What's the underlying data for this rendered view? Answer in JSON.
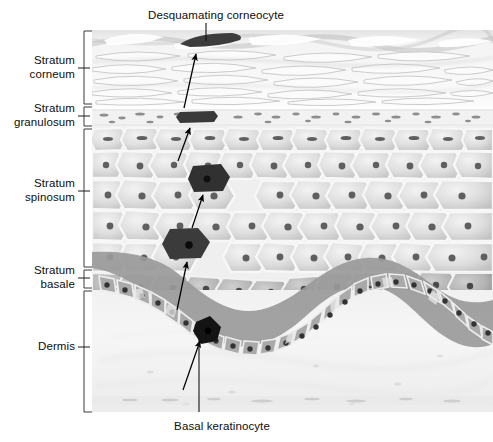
{
  "figure": {
    "width": 493,
    "height": 442,
    "background": "#ffffff"
  },
  "callouts": {
    "top": {
      "text": "Desquamating corneocyte",
      "x": 216,
      "y": 16
    },
    "bottom": {
      "text": "Basal keratinocyte",
      "x": 222,
      "y": 427
    }
  },
  "layers": [
    {
      "id": "stratum-corneum",
      "label": "Stratum\ncorneum",
      "label_x": 75,
      "label_y": 61,
      "tick_y": 68,
      "bracket_top": 31,
      "bracket_bottom": 104,
      "description": "Flattened anucleate squames, wavy horizontal bands"
    },
    {
      "id": "stratum-granulosum",
      "label": "Stratum\ngranulosum",
      "label_x": 75,
      "label_y": 109,
      "tick_y": 116,
      "bracket_top": 107,
      "bracket_bottom": 126,
      "description": "Thin granular layer with keratohyalin granules"
    },
    {
      "id": "stratum-spinosum",
      "label": "Stratum\nspinosum",
      "label_x": 75,
      "label_y": 184,
      "tick_y": 191,
      "bracket_top": 129,
      "bracket_bottom": 267,
      "description": "Polygonal cells with round nuclei"
    },
    {
      "id": "stratum-basale",
      "label": "Stratum\nbasale",
      "label_x": 75,
      "label_y": 271,
      "tick_y": 278,
      "bracket_top": 270,
      "bracket_bottom": 288,
      "description": "Single row of columnar basal cells on undulating dermal junction"
    },
    {
      "id": "dermis",
      "label": "Dermis",
      "label_x": 75,
      "label_y": 341,
      "tick_y": 347,
      "bracket_top": 291,
      "bracket_bottom": 412,
      "description": "Pale connective tissue below basal layer"
    }
  ],
  "marked_cells": [
    {
      "id": "corneocyte-desquamating",
      "x": 208,
      "y": 40,
      "stage": "shedding at surface"
    },
    {
      "id": "corneocyte-granular",
      "x": 198,
      "y": 118,
      "stage": "flattened in granular layer"
    },
    {
      "id": "keratinocyte-upper-spinous",
      "x": 208,
      "y": 178,
      "stage": "upper spinous"
    },
    {
      "id": "keratinocyte-lower-spinous",
      "x": 189,
      "y": 243,
      "stage": "lower spinous"
    },
    {
      "id": "keratinocyte-basal",
      "x": 207,
      "y": 331,
      "stage": "basal, dividing"
    }
  ],
  "migration_arrows": [
    {
      "from_cell": "keratinocyte-basal",
      "to_cell": "keratinocyte-lower-spinous"
    },
    {
      "from_cell": "keratinocyte-lower-spinous",
      "to_cell": "keratinocyte-upper-spinous"
    },
    {
      "from_cell": "keratinocyte-upper-spinous",
      "to_cell": "corneocyte-granular"
    },
    {
      "from_cell": "corneocyte-granular",
      "to_cell": "corneocyte-desquamating"
    }
  ],
  "colors": {
    "text": "#0d0d0d",
    "bracket": "#3a3a3a",
    "arrow": "#000000",
    "marked_cell": "#2b2b2b",
    "cell_body": "#d8d8d8",
    "cell_outline": "#f2f2f2",
    "nucleus": "#5a5a5a",
    "dermis": "#f0f0f0",
    "basal_band": "#8c8c8c"
  }
}
